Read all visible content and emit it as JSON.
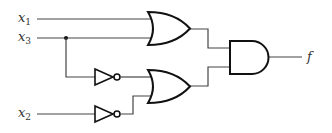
{
  "diagram": {
    "type": "logic-circuit",
    "inputs": [
      {
        "var": "x",
        "sub": "1"
      },
      {
        "var": "x",
        "sub": "3"
      },
      {
        "var": "x",
        "sub": "2"
      }
    ],
    "output": {
      "var": "f"
    },
    "gates": [
      {
        "id": "or1",
        "type": "OR",
        "inputs": [
          "x1",
          "x3"
        ]
      },
      {
        "id": "not1",
        "type": "NOT",
        "inputs": [
          "x3"
        ]
      },
      {
        "id": "not2",
        "type": "NOT",
        "inputs": [
          "x2"
        ]
      },
      {
        "id": "or2",
        "type": "OR",
        "inputs": [
          "not1",
          "not2"
        ]
      },
      {
        "id": "and1",
        "type": "AND",
        "inputs": [
          "or1",
          "or2"
        ],
        "output": "f"
      }
    ],
    "colors": {
      "wire": "#444444",
      "gate": "#111111",
      "background": "#ffffff"
    }
  }
}
